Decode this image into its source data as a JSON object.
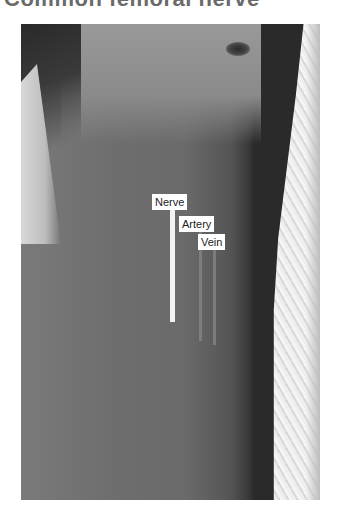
{
  "title": "Common femoral nerve",
  "figure": {
    "labels": {
      "nerve": "Nerve",
      "artery": "Artery",
      "vein": "Vein"
    }
  },
  "colors": {
    "label_bg": "#ffffff",
    "nerve_line": "#f2f2f2",
    "title": "#6a6a6a"
  }
}
